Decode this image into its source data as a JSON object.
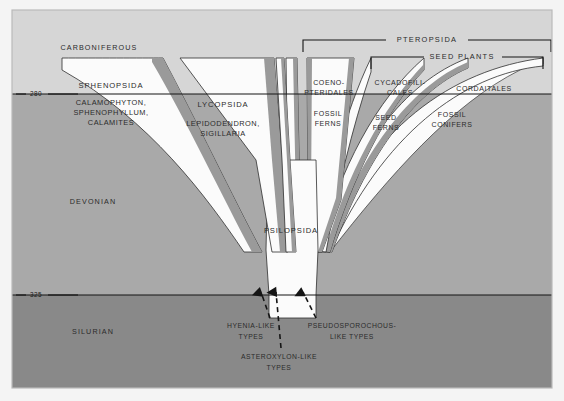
{
  "figure": {
    "kind": "stratigraphic-phylogeny-diagram",
    "background_color": "#f2f2f2",
    "frame": {
      "x": 12,
      "y": 10,
      "width": 540,
      "height": 378,
      "border_color": "#b9b9b9"
    }
  },
  "palette": {
    "carboniferous": "#d6d6d6",
    "devonian": "#a9a9a9",
    "silurian": "#898989",
    "cone_fill": "#fbfbfb",
    "cone_shadow": "#9a9a9a",
    "line": "#1a1a1a",
    "text": "#2b2b2b"
  },
  "eras": [
    {
      "name": "CARBONIFEROUS",
      "label": "CARBONIFEROUS",
      "label_x": 99,
      "label_y": 48,
      "fill": "#d6d6d6"
    },
    {
      "name": "DEVONIAN",
      "label": "DEVONIAN",
      "label_x": 93,
      "label_y": 202,
      "fill": "#a9a9a9"
    },
    {
      "name": "SILURIAN",
      "label": "SILURIAN",
      "label_x": 93,
      "label_y": 332,
      "fill": "#898989"
    }
  ],
  "time_axis": {
    "unit": "million years",
    "ticks": [
      {
        "value": "280",
        "label": "280",
        "y": 94,
        "label_x": 36,
        "dash_left_x1": 16,
        "dash_left_x2": 26,
        "dash_right_x1": 48,
        "dash_right_x2": 78
      },
      {
        "value": "325",
        "label": "325",
        "y": 295,
        "label_x": 36,
        "dash_left_x1": 16,
        "dash_left_x2": 26,
        "dash_right_x1": 48,
        "dash_right_x2": 78
      }
    ]
  },
  "brackets": [
    {
      "name": "PTEROPSIDA",
      "label": "PTEROPSIDA",
      "x1": 303,
      "x2": 551,
      "y": 40,
      "tick_drop": 12,
      "label_x": 427,
      "label_y": 40
    },
    {
      "name": "SEED PLANTS",
      "label": "SEED  PLANTS",
      "x1": 371,
      "x2": 543,
      "y": 57,
      "tick_drop": 12,
      "label_x": 462,
      "label_y": 57
    }
  ],
  "taxa": [
    {
      "name": "SPHENOPSIDA",
      "label": "SPHENOPSIDA",
      "label_x": 111,
      "label_y": 86
    },
    {
      "name": "LYCOPSIDA",
      "label": "LYCOPSIDA",
      "label_x": 223,
      "label_y": 105
    },
    {
      "name": "PSILOPSIDA",
      "label": "PSILOPSIDA",
      "label_x": 291,
      "label_y": 231
    },
    {
      "name": "COENOPTERIDALES",
      "label_lines": [
        "COENO-",
        "PTERIDALES"
      ],
      "label_x": 329,
      "label_y": 87,
      "line_gap": 10
    },
    {
      "name": "CYCADOFILICALES",
      "label_lines": [
        "CYCADOFILI-",
        "CALES"
      ],
      "label_x": 400,
      "label_y": 87,
      "line_gap": 10
    },
    {
      "name": "CORDAITALES",
      "label": "CORDAITALES",
      "label_x": 484,
      "label_y": 89
    }
  ],
  "genus_groups": [
    {
      "name": "sphenopsida-genera",
      "lines": [
        "CALAMOPHYTON,",
        "SPHENOPHYLLUM,",
        "CALAMITES"
      ],
      "label_x": 111,
      "label_y": 107,
      "line_gap": 10.5
    },
    {
      "name": "lycopsida-genera",
      "lines": [
        "LEPIDODENDRON,",
        "SIGILLARIA"
      ],
      "label_x": 223,
      "label_y": 126,
      "line_gap": 10.5
    },
    {
      "name": "fossil-ferns",
      "lines": [
        "FOSSIL",
        "FERNS"
      ],
      "label_x": 328,
      "label_y": 118,
      "line_gap": 10.5
    },
    {
      "name": "seed-ferns",
      "lines": [
        "SEED",
        "FERNS"
      ],
      "label_x": 386,
      "label_y": 122,
      "line_gap": 10.5
    },
    {
      "name": "fossil-conifers",
      "lines": [
        "FOSSIL",
        "CONIFERS"
      ],
      "label_x": 452,
      "label_y": 120,
      "line_gap": 10.5
    }
  ],
  "root_ancestors": [
    {
      "name": "hyenia-like-types",
      "lines": [
        "HYENIA-LIKE",
        "TYPES"
      ],
      "label_x": 251,
      "label_y": 326,
      "line_gap": 10.5,
      "arrow": {
        "x1": 270,
        "y1": 318,
        "x2": 261,
        "y2": 292
      }
    },
    {
      "name": "asteroxylon-like-types",
      "lines": [
        "ASTEROXYLON-LIKE",
        "TYPES"
      ],
      "label_x": 279,
      "label_y": 357,
      "line_gap": 10.5,
      "arrow": {
        "x1": 281,
        "y1": 348,
        "x2": 276,
        "y2": 292
      }
    },
    {
      "name": "pseudosporochous-like-types",
      "lines": [
        "PSEUDOSPOROCHOUS-",
        "LIKE  TYPES"
      ],
      "label_x": 349,
      "label_y": 326,
      "line_gap": 10.5,
      "arrow": {
        "x1": 316,
        "y1": 318,
        "x2": 303,
        "y2": 292
      }
    }
  ]
}
